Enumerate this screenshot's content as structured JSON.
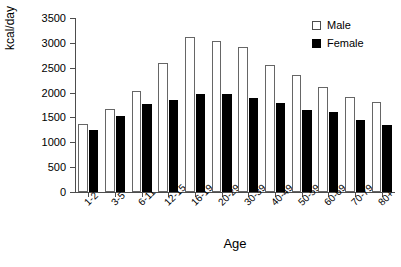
{
  "chart_data": {
    "type": "bar",
    "title": "",
    "subtitle": "",
    "xlabel": "Age",
    "ylabel": "kcal/day",
    "categories": [
      "1-2",
      "3-5",
      "6-11",
      "12-15",
      "16-19",
      "20-29",
      "30-39",
      "40-49",
      "50-59",
      "60-69",
      "70-79",
      "80+"
    ],
    "series": [
      {
        "name": "Male",
        "color": "#ffffff",
        "edge_color": "#666666",
        "values": [
          1370,
          1660,
          2040,
          2590,
          3110,
          3040,
          2910,
          2560,
          2350,
          2110,
          1910,
          1810
        ]
      },
      {
        "name": "Female",
        "color": "#000000",
        "edge_color": "#000000",
        "values": [
          1250,
          1530,
          1770,
          1860,
          1970,
          1970,
          1890,
          1790,
          1640,
          1610,
          1450,
          1340
        ]
      }
    ],
    "ylim": [
      0,
      3500
    ],
    "yticks": [
      0,
      500,
      1000,
      1500,
      2000,
      2500,
      3000,
      3500
    ],
    "ytick_labels": [
      "0",
      "500",
      "1000",
      "1500",
      "2000",
      "2500",
      "3000",
      "3500"
    ],
    "grid": false,
    "legend_position": "top-right",
    "legend": [
      "Male",
      "Female"
    ]
  }
}
